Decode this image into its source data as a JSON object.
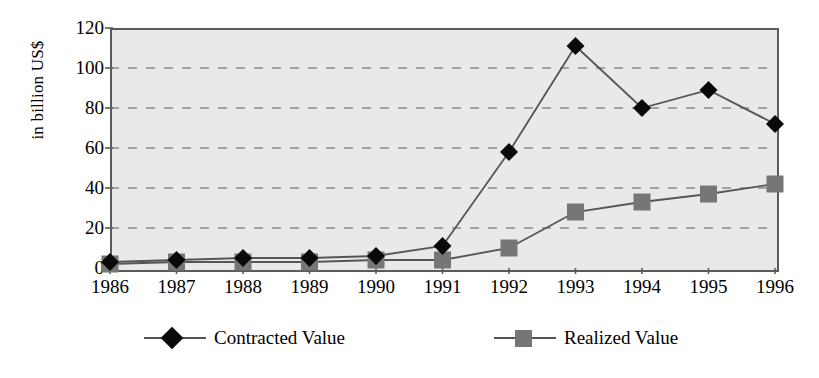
{
  "chart_data": {
    "type": "line",
    "title": "",
    "subtitle": "",
    "xlabel": "",
    "ylabel": "in billion US$",
    "ylim": [
      0,
      120
    ],
    "ytick_step": 20,
    "yticks": [
      0,
      20,
      40,
      60,
      80,
      100,
      120
    ],
    "ytick_labels": [
      "0",
      "20",
      "40",
      "60",
      "80",
      "100",
      "120"
    ],
    "categories": [
      "1986",
      "1987",
      "1988",
      "1989",
      "1990",
      "1991",
      "1992",
      "1993",
      "1994",
      "1995",
      "1996"
    ],
    "grid": true,
    "grid_style": "dashed-horizontal",
    "legend_position": "bottom",
    "plot_background": "#e9e9e9",
    "series": [
      {
        "name": "Contracted Value",
        "marker": "diamond",
        "color": "#0a0a0a",
        "line_color": "#555555",
        "values": [
          3,
          4,
          5,
          5,
          6,
          11,
          58,
          111,
          80,
          89,
          72
        ]
      },
      {
        "name": "Realized Value",
        "marker": "square",
        "color": "#767676",
        "line_color": "#555555",
        "values": [
          2,
          3,
          3,
          3,
          4,
          4,
          10,
          28,
          33,
          37,
          42
        ]
      }
    ]
  },
  "legend": {
    "entries": [
      {
        "label": "Contracted Value"
      },
      {
        "label": "Realized Value"
      }
    ]
  },
  "axis": {
    "y_title": "in billion US$"
  }
}
